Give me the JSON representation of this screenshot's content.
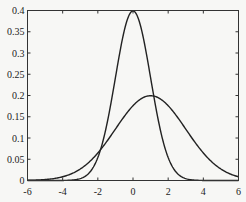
{
  "chart_data": {
    "type": "line",
    "title": "",
    "xlabel": "",
    "ylabel": "",
    "xlim": [
      -6,
      6
    ],
    "ylim": [
      0,
      0.4
    ],
    "grid": false,
    "legend": null,
    "xticks": [
      -6,
      -4,
      -2,
      0,
      2,
      4,
      6
    ],
    "xtick_labels": [
      "-6",
      "-4",
      "-2",
      "0",
      "2",
      "4",
      "6"
    ],
    "yticks": [
      0,
      0.05,
      0.1,
      0.15,
      0.2,
      0.25,
      0.3,
      0.35,
      0.4
    ],
    "ytick_labels": [
      "0",
      "0.05",
      "0.1",
      "0.15",
      "0.2",
      "0.25",
      "0.3",
      "0.35",
      "0.4"
    ],
    "series": [
      {
        "name": "normal pdf mu=0 sigma=1",
        "mu": 0,
        "sigma": 1,
        "peak": [
          0,
          0.399
        ],
        "color": "#222222"
      },
      {
        "name": "normal pdf mu=1 sigma=2",
        "mu": 1,
        "sigma": 2,
        "peak": [
          1,
          0.199
        ],
        "color": "#222222"
      }
    ]
  },
  "colors": {
    "axis": "#333333",
    "line": "#222222",
    "background": "#f7f7f5"
  }
}
